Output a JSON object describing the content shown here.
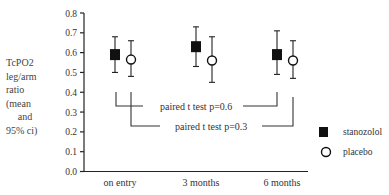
{
  "chart_data": {
    "type": "scatter",
    "subtype": "dot plot with 95% CI error bars",
    "title": "",
    "ylabel_lines": [
      "TcPO2",
      "leg/arm",
      "ratio",
      "(mean",
      "and",
      "95% ci)"
    ],
    "xlabel": "",
    "ylim": [
      0.0,
      0.8
    ],
    "yticks": [
      "0.0",
      "0.1",
      "0.2",
      "0.3",
      "0.4",
      "0.5",
      "0.6",
      "0.7",
      "0.8"
    ],
    "categories": [
      "on entry",
      "3 months",
      "6 months"
    ],
    "grid": false,
    "legend_position": "right",
    "series": [
      {
        "name": "stanozolol",
        "marker": "filled-square",
        "color": "#111111",
        "values": [
          0.59,
          0.63,
          0.59
        ],
        "ci_low": [
          0.5,
          0.53,
          0.49
        ],
        "ci_high": [
          0.68,
          0.73,
          0.71
        ]
      },
      {
        "name": "placebo",
        "marker": "open-circle",
        "color": "#111111",
        "values": [
          0.565,
          0.56,
          0.56
        ],
        "ci_low": [
          0.48,
          0.45,
          0.47
        ],
        "ci_high": [
          0.66,
          0.68,
          0.66
        ]
      }
    ],
    "annotations": [
      {
        "text": "paired t test p=0.6",
        "compares": "stanozolol on entry vs 6 months"
      },
      {
        "text": "paired t test p=0.3",
        "compares": "placebo on entry vs 6 months"
      }
    ]
  }
}
